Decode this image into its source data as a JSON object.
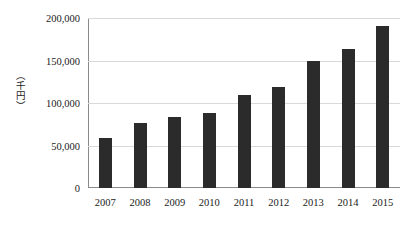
{
  "chart_data": {
    "type": "bar",
    "title": "",
    "subtitle": "",
    "xlabel": "",
    "ylabel": "（千円）",
    "categories": [
      "2007",
      "2008",
      "2009",
      "2010",
      "2011",
      "2012",
      "2013",
      "2014",
      "2015"
    ],
    "values": [
      58700,
      76800,
      83500,
      88200,
      109400,
      118500,
      149200,
      163000,
      190900
    ],
    "ylim": [
      0,
      200000
    ],
    "y_ticks": [
      0,
      50000,
      100000,
      150000,
      200000
    ],
    "y_tick_labels": [
      "0",
      "50,000",
      "100,000",
      "150,000",
      "200,000"
    ],
    "grid": true,
    "grid_axis": "y",
    "legend": false,
    "legend_position": "none",
    "bar_color": "#2b2b2b",
    "gridline_color": "#d9d9d9",
    "axis_color": "#8a8a8a",
    "background_color": "#ffffff",
    "series": [
      {
        "name": "",
        "values": [
          58700,
          76800,
          83500,
          88200,
          109400,
          118500,
          149200,
          163000,
          190900
        ]
      }
    ]
  }
}
